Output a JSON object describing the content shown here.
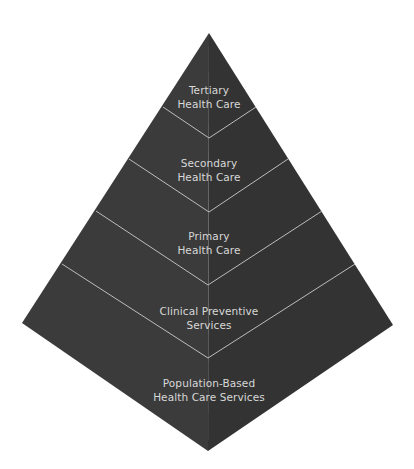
{
  "diagram": {
    "type": "pyramid",
    "colors": {
      "background": "#ffffff",
      "left_face": "#3b3b3b",
      "right_face": "#333333",
      "divider_line": "#bdbdbd",
      "text": "#d8d8d8"
    },
    "tiers": [
      {
        "line1": "Tertiary",
        "line2": "Health Care"
      },
      {
        "line1": "Secondary",
        "line2": "Health Care"
      },
      {
        "line1": "Primary",
        "line2": "Health Care"
      },
      {
        "line1": "Clinical Preventive",
        "line2": "Services"
      },
      {
        "line1": "Population-Based",
        "line2": "Health Care Services"
      }
    ]
  }
}
